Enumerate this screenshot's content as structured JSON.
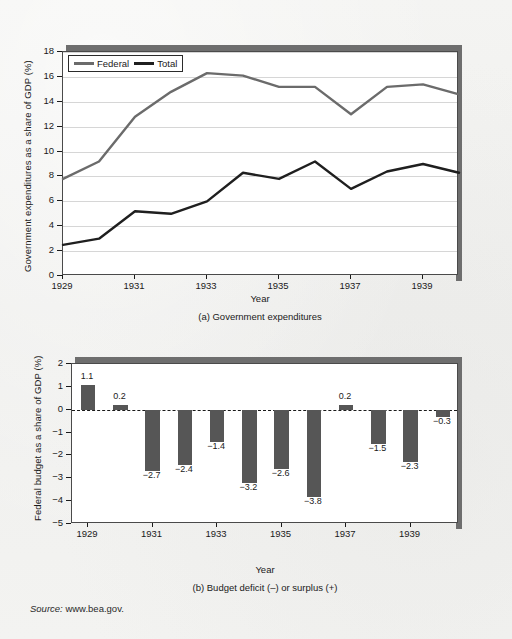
{
  "figure": {
    "source_note_prefix": "Source:",
    "source_note_url": "www.bea.gov."
  },
  "panel_a": {
    "caption": "(a) Government expenditures",
    "xlabel": "Year",
    "ylabel": "Government expenditures as a share of GDP (%)",
    "legend": [
      {
        "label": "Federal",
        "color": "#6b6b6b"
      },
      {
        "label": "Total",
        "color": "#1f1f1f"
      }
    ],
    "ytick_labels": [
      "0",
      "2",
      "4",
      "6",
      "8",
      "10",
      "12",
      "14",
      "16",
      "18"
    ],
    "xtick_labels": [
      "1929",
      "1931",
      "1933",
      "1935",
      "1937",
      "1939"
    ]
  },
  "panel_b": {
    "caption": "(b) Budget deficit (–) or surplus (+)",
    "xlabel": "Year",
    "ylabel": "Federal budget as a share of GDP (%)",
    "ytick_labels": [
      "2",
      "1",
      "0",
      "−1",
      "−2",
      "−3",
      "−4",
      "−5"
    ],
    "xtick_labels": [
      "1929",
      "1931",
      "1933",
      "1935",
      "1937",
      "1939"
    ],
    "bar_labels": [
      "1.1",
      "0.2",
      "−2.7",
      "−2.4",
      "−1.4",
      "−3.2",
      "−2.6",
      "−3.8",
      "0.2",
      "−1.5",
      "−2.3",
      "−0.3"
    ],
    "bar_color": "#565656"
  },
  "chart_data": [
    {
      "type": "line",
      "title": "(a) Government expenditures",
      "xlabel": "Year",
      "ylabel": "Government expenditures as a share of GDP (%)",
      "x": [
        1929,
        1930,
        1931,
        1932,
        1933,
        1934,
        1935,
        1936,
        1937,
        1938,
        1939,
        1940
      ],
      "xlim": [
        1929,
        1940
      ],
      "ylim": [
        0,
        18
      ],
      "yticks": [
        0,
        2,
        4,
        6,
        8,
        10,
        12,
        14,
        16,
        18
      ],
      "xticks": [
        1929,
        1931,
        1933,
        1935,
        1937,
        1939
      ],
      "grid": true,
      "legend_position": "top-left",
      "series": [
        {
          "name": "Total",
          "color": "#6b6b6b",
          "values": [
            7.8,
            9.2,
            12.8,
            14.8,
            16.3,
            16.1,
            15.2,
            15.2,
            13.0,
            15.2,
            15.4,
            14.6
          ]
        },
        {
          "name": "Federal",
          "color": "#1f1f1f",
          "values": [
            2.5,
            3.0,
            5.2,
            5.0,
            6.0,
            8.3,
            7.8,
            9.2,
            7.0,
            8.4,
            9.0,
            8.3
          ]
        }
      ]
    },
    {
      "type": "bar",
      "title": "(b) Budget deficit (–) or surplus (+)",
      "xlabel": "Year",
      "ylabel": "Federal budget as a share of GDP (%)",
      "categories": [
        1929,
        1930,
        1931,
        1932,
        1933,
        1934,
        1935,
        1936,
        1937,
        1938,
        1939,
        1940
      ],
      "values": [
        1.1,
        0.2,
        -2.7,
        -2.4,
        -1.4,
        -3.2,
        -2.6,
        -3.8,
        0.2,
        -1.5,
        -2.3,
        -0.3
      ],
      "ylim": [
        -5,
        2
      ],
      "yticks": [
        2,
        1,
        0,
        -1,
        -2,
        -3,
        -4,
        -5
      ],
      "xticks": [
        1929,
        1931,
        1933,
        1935,
        1937,
        1939
      ],
      "grid": false,
      "zero_line": true,
      "bar_color": "#565656",
      "data_labels": [
        "1.1",
        "0.2",
        "−2.7",
        "−2.4",
        "−1.4",
        "−3.2",
        "−2.6",
        "−3.8",
        "0.2",
        "−1.5",
        "−2.3",
        "−0.3"
      ]
    }
  ]
}
